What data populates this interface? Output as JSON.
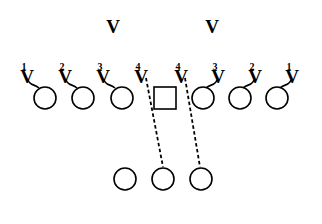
{
  "diagram": {
    "type": "football-play-diagram",
    "colors": {
      "ink": "#000000",
      "background": "#ffffff"
    },
    "deep_defenders": [
      {
        "label": "V",
        "x": 113,
        "y": 33
      },
      {
        "label": "V",
        "x": 212,
        "y": 33
      }
    ],
    "line_defenders": [
      {
        "number": "1",
        "label": "V",
        "x": 27,
        "side": "left",
        "hook": "right"
      },
      {
        "number": "2",
        "label": "V",
        "x": 65,
        "side": "left",
        "hook": "right"
      },
      {
        "number": "3",
        "label": "V",
        "x": 103,
        "side": "left",
        "hook": "right"
      },
      {
        "number": "4",
        "label": "V",
        "x": 141,
        "side": "left",
        "hook": "none"
      },
      {
        "number": "4",
        "label": "V",
        "x": 181,
        "side": "right",
        "hook": "none"
      },
      {
        "number": "3",
        "label": "V",
        "x": 218,
        "side": "right",
        "hook": "left"
      },
      {
        "number": "2",
        "label": "V",
        "x": 255,
        "side": "right",
        "hook": "left"
      },
      {
        "number": "1",
        "label": "V",
        "x": 292,
        "side": "right",
        "hook": "left"
      }
    ],
    "offensive_line": {
      "circles": [
        45,
        83,
        122,
        203,
        240,
        277
      ],
      "center_square": {
        "x": 165,
        "y": 98,
        "size": 22
      },
      "y": 98,
      "radius": 11
    },
    "backfield": {
      "circles": [
        125,
        163,
        201
      ],
      "y": 179,
      "radius": 11
    },
    "dashed_paths": [
      {
        "from": [
          146,
          78
        ],
        "to": [
          163,
          167
        ]
      },
      {
        "from": [
          185,
          78
        ],
        "to": [
          200,
          167
        ]
      }
    ]
  }
}
